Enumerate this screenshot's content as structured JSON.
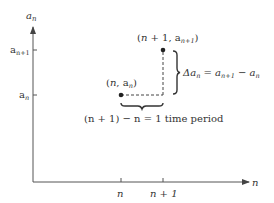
{
  "axes": {
    "y_label": "a",
    "y_label_sub": "n",
    "x_label": "n",
    "y_ticks": [
      {
        "label": "a",
        "sub": "n+1"
      },
      {
        "label": "a",
        "sub": "n"
      }
    ],
    "x_ticks": [
      {
        "label": "n"
      },
      {
        "label": "n + 1"
      }
    ]
  },
  "points": [
    {
      "label_open": "(",
      "label_var": "n",
      "label_mid": ", a",
      "label_sub": "n",
      "label_close": ")"
    },
    {
      "label_open": "(",
      "label_var": "n",
      "label_mid": " + 1, a",
      "label_sub": "n+1",
      "label_close": ")"
    }
  ],
  "annotations": {
    "delta_lhs": "Δa",
    "delta_lhs_sub": "n",
    "delta_eq": " = a",
    "delta_rhs1_sub": "n+1",
    "delta_minus": " − a",
    "delta_rhs2_sub": "n",
    "period_text": "(n + 1) − n = 1 time period"
  },
  "colors": {
    "axis": "#444444",
    "text": "#333333",
    "point": "#222222"
  }
}
